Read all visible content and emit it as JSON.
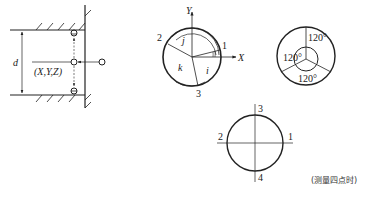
{
  "figure": {
    "bore_section": {
      "dimension_label": "d",
      "probe_point_label": "(X,Y,Z)"
    },
    "three_point_circle": {
      "axis_y_label": "Y",
      "axis_x_label": "X",
      "point_labels": [
        "1",
        "2",
        "3"
      ],
      "angle_labels": [
        "i",
        "j",
        "k"
      ]
    },
    "spacing_circle": {
      "angle_labels": [
        "120°",
        "120°",
        "120°"
      ]
    },
    "four_point_circle": {
      "point_labels": [
        "1",
        "2",
        "3",
        "4"
      ],
      "caption": "(测量四点时)"
    }
  },
  "colors": {
    "stroke": "#222222",
    "background": "#ffffff"
  }
}
